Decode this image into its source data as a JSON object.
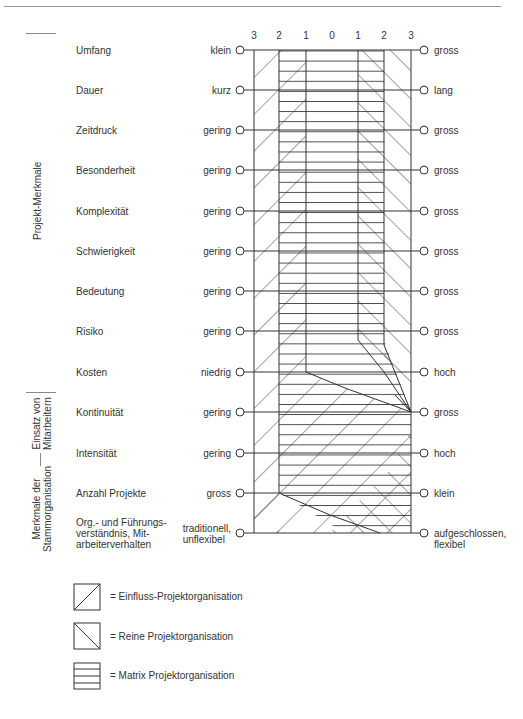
{
  "scale": {
    "ticks": [
      "3",
      "2",
      "1",
      "0",
      "1",
      "2",
      "3"
    ]
  },
  "sections": [
    {
      "label": "Projekt-Merkmale"
    },
    {
      "label_line1": "Einsatz von",
      "label_line2": "Mitarbeitern"
    },
    {
      "label_line1": "Merkmale der",
      "label_line2": "Stammorganisation"
    }
  ],
  "rows": [
    {
      "criterion": "Umfang",
      "low": "klein",
      "high": "gross"
    },
    {
      "criterion": "Dauer",
      "low": "kurz",
      "high": "lang"
    },
    {
      "criterion": "Zeitdruck",
      "low": "gering",
      "high": "gross"
    },
    {
      "criterion": "Besonderheit",
      "low": "gering",
      "high": "gross"
    },
    {
      "criterion": "Komplexität",
      "low": "gering",
      "high": "gross"
    },
    {
      "criterion": "Schwierigkeit",
      "low": "gering",
      "high": "gross"
    },
    {
      "criterion": "Bedeutung",
      "low": "gering",
      "high": "gross"
    },
    {
      "criterion": "Risiko",
      "low": "gering",
      "high": "gross"
    },
    {
      "criterion": "Kosten",
      "low": "niedrig",
      "high": "hoch"
    },
    {
      "criterion": "Kontinuität",
      "low": "gering",
      "high": "gross"
    },
    {
      "criterion": "Intensität",
      "low": "gering",
      "high": "hoch"
    },
    {
      "criterion": "Anzahl Projekte",
      "low": "gross",
      "high": "klein"
    },
    {
      "criterion_line1": "Org.- und Führungs-",
      "criterion_line2": "verständnis, Mit-",
      "criterion_line3": "arbeiterverhalten",
      "low_line1": "traditionell,",
      "low_line2": "unflexibel",
      "high_line1": "aufgeschlossen,",
      "high_line2": "flexibel"
    }
  ],
  "legend": [
    {
      "pattern": "diagonal-up",
      "label": "= Einfluss-Projektorganisation"
    },
    {
      "pattern": "diagonal-down",
      "label": "= Reine Projektorganisation"
    },
    {
      "pattern": "horizontal",
      "label": "= Matrix Projektorganisation"
    }
  ],
  "colors": {
    "line": "#333333",
    "text": "#333333",
    "rule": "#999999"
  }
}
